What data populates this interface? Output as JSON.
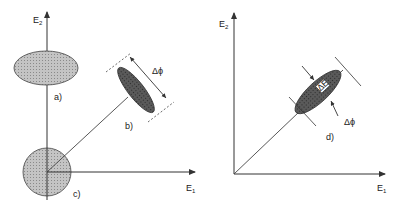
{
  "left_panel": {
    "y_axis_label": "E",
    "y_axis_sub": "2",
    "x_axis_label": "E",
    "x_axis_sub": "1",
    "labels": {
      "a": "a)",
      "b": "b)",
      "c": "c)"
    },
    "delta_phi": "Δϕ"
  },
  "right_panel": {
    "y_axis_label": "E",
    "y_axis_sub": "2",
    "x_axis_label": "E",
    "x_axis_sub": "1",
    "labels": {
      "d": "d)"
    },
    "delta_e": "ΔE",
    "delta_phi": "Δϕ"
  },
  "colors": {
    "fill_light": "#b5b5b5",
    "fill_dark": "#555555",
    "stroke": "#333333"
  }
}
